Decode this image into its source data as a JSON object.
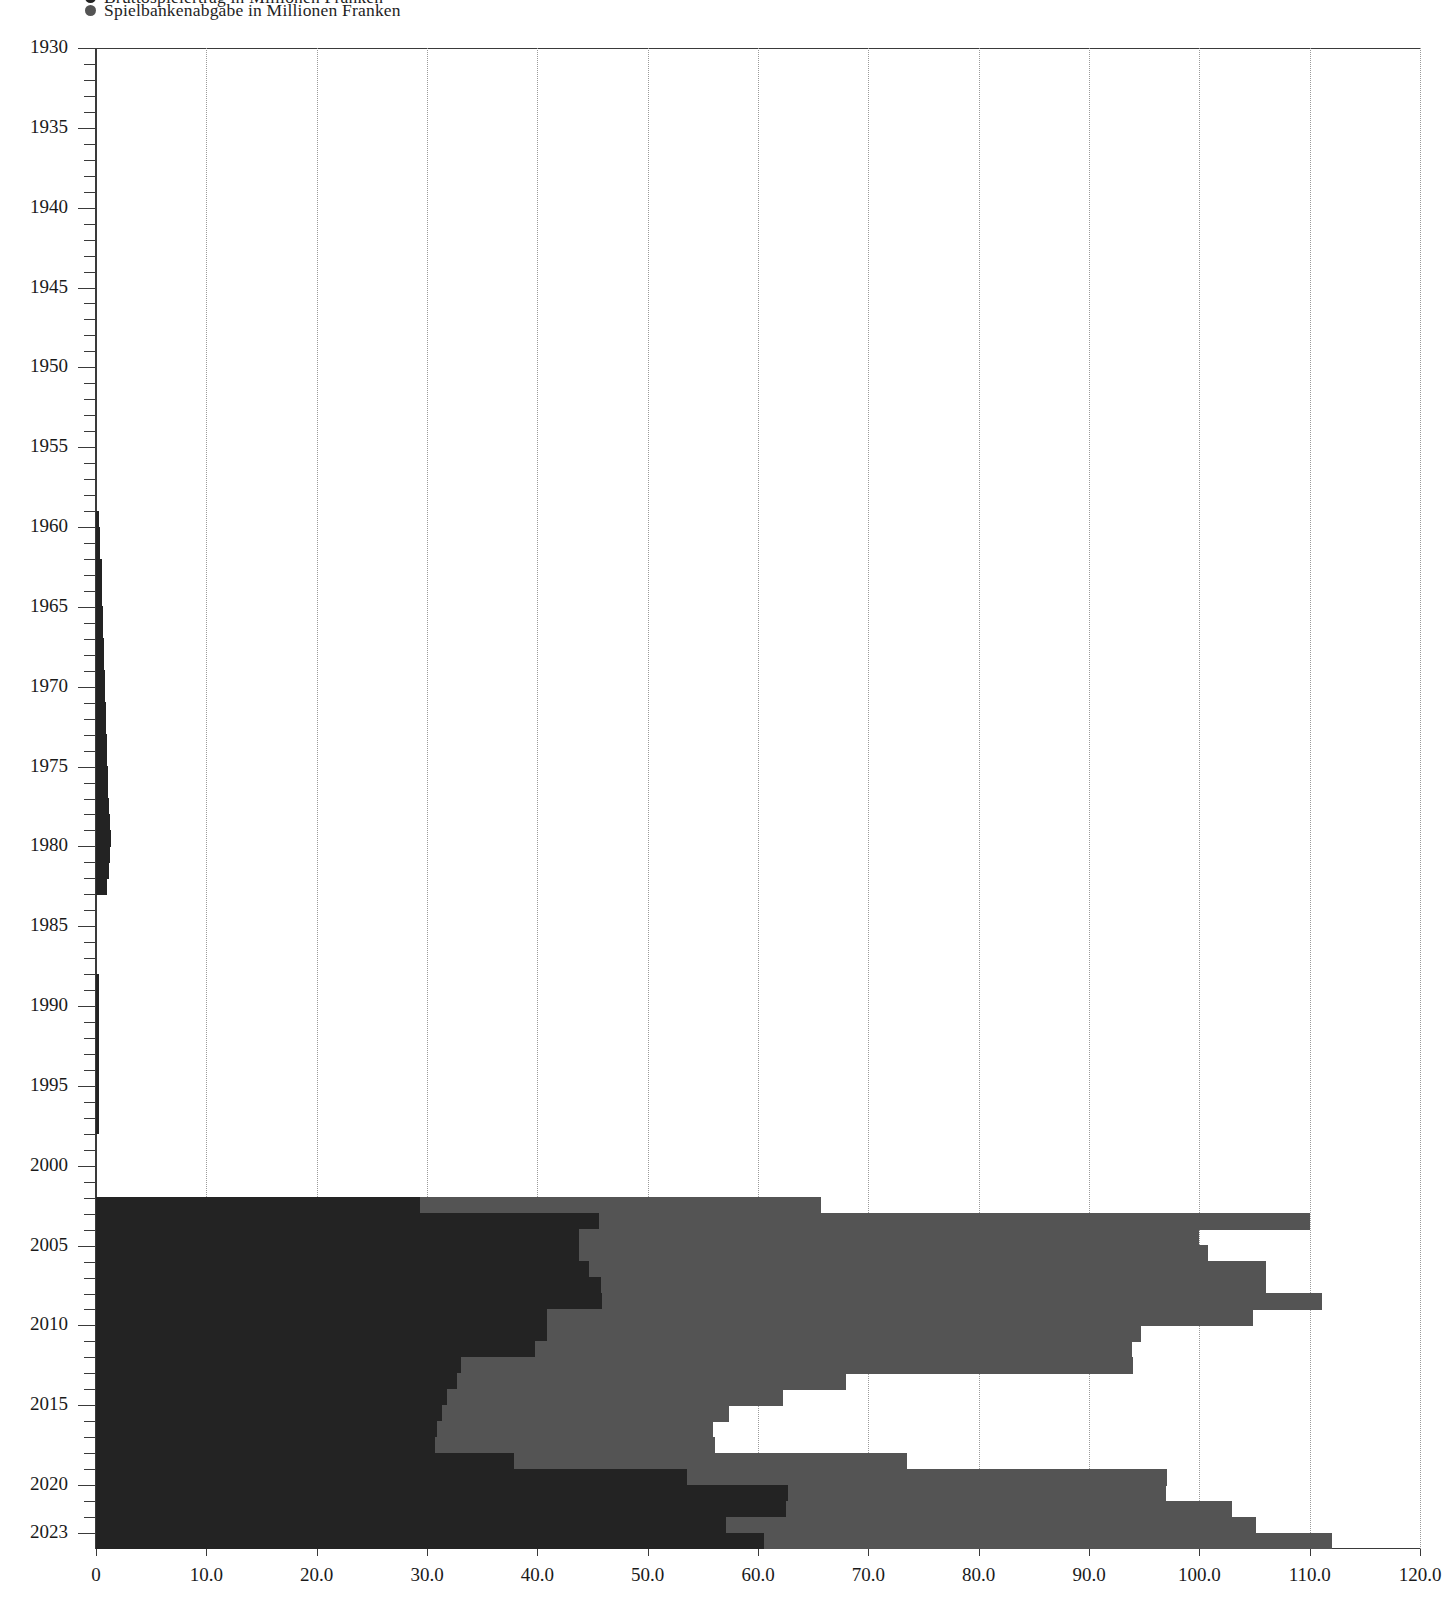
{
  "legend": {
    "clipped_label": "Bruttospielertrag in Millionen Franken",
    "main_label": "Spielbankenabgabe in Millionen Franken",
    "dot_color_clipped": "#232323",
    "dot_color_main": "#545454"
  },
  "axes": {
    "x_labels": [
      "0",
      "10.0",
      "20.0",
      "30.0",
      "40.0",
      "50.0",
      "60.0",
      "70.0",
      "80.0",
      "90.0",
      "100.0",
      "110.0",
      "120.0"
    ],
    "x_values": [
      0,
      10,
      20,
      30,
      40,
      50,
      60,
      70,
      80,
      90,
      100,
      110,
      120
    ],
    "y_labels": [
      "1930",
      "1935",
      "1940",
      "1945",
      "1950",
      "1955",
      "1960",
      "1965",
      "1970",
      "1975",
      "1980",
      "1985",
      "1990",
      "1995",
      "2000",
      "2005",
      "2010",
      "2015",
      "2020",
      "2023"
    ],
    "y_major_values": [
      1930,
      1935,
      1940,
      1945,
      1950,
      1955,
      1960,
      1965,
      1970,
      1975,
      1980,
      1985,
      1990,
      1995,
      2000,
      2005,
      2010,
      2015,
      2020,
      2023
    ],
    "y_min": 1930,
    "y_max": 2023
  },
  "chart_data": {
    "type": "bar",
    "orientation": "horizontal",
    "stacked": true,
    "title": "",
    "xlabel": "",
    "ylabel": "",
    "xlim": [
      0,
      120
    ],
    "ylim": [
      1930,
      2023
    ],
    "grid": "vertical-dotted",
    "legend_position": "top-left",
    "series": [
      {
        "name": "Spielbankenabgabe in Millionen Franken",
        "color": "#232323"
      },
      {
        "name": "weiterer Anteil in Millionen Franken",
        "color": "#545454"
      }
    ],
    "categories": [
      1959,
      1960,
      1961,
      1962,
      1963,
      1964,
      1965,
      1966,
      1967,
      1968,
      1969,
      1970,
      1971,
      1972,
      1973,
      1974,
      1975,
      1976,
      1977,
      1978,
      1979,
      1980,
      1981,
      1982,
      1988,
      1989,
      1990,
      1991,
      1992,
      1993,
      1994,
      1995,
      1996,
      1997,
      2002,
      2003,
      2004,
      2005,
      2006,
      2007,
      2008,
      2009,
      2010,
      2011,
      2012,
      2013,
      2014,
      2015,
      2016,
      2017,
      2018,
      2019,
      2020,
      2021,
      2022,
      2023
    ],
    "dark_values": [
      0.3,
      0.4,
      0.4,
      0.5,
      0.5,
      0.5,
      0.6,
      0.6,
      0.7,
      0.7,
      0.8,
      0.8,
      0.9,
      0.9,
      1.0,
      1.0,
      1.1,
      1.1,
      1.2,
      1.3,
      1.4,
      1.3,
      1.2,
      1.0,
      0.3,
      0.3,
      0.3,
      0.3,
      0.3,
      0.3,
      0.3,
      0.3,
      0.3,
      0.3,
      29.4,
      45.6,
      43.8,
      43.8,
      44.7,
      45.8,
      45.9,
      40.9,
      40.9,
      39.8,
      33.1,
      32.7,
      31.8,
      31.4,
      30.9,
      30.7,
      37.9,
      53.6,
      62.7,
      62.5,
      57.1,
      60.5
    ],
    "light_values": [
      0,
      0,
      0,
      0,
      0,
      0,
      0,
      0,
      0,
      0,
      0,
      0,
      0,
      0,
      0,
      0,
      0,
      0,
      0,
      0,
      0,
      0,
      0,
      0,
      0,
      0,
      0,
      0,
      0,
      0,
      0,
      0,
      0,
      0,
      36.3,
      64.4,
      56.2,
      57.0,
      61.3,
      60.2,
      65.2,
      64.0,
      53.8,
      54.1,
      60.9,
      35.3,
      30.5,
      26.0,
      25.0,
      25.4,
      35.6,
      43.5,
      34.3,
      40.5,
      48.0,
      51.5
    ],
    "totals": [
      0.3,
      0.4,
      0.4,
      0.5,
      0.5,
      0.5,
      0.6,
      0.6,
      0.7,
      0.7,
      0.8,
      0.8,
      0.9,
      0.9,
      1.0,
      1.0,
      1.1,
      1.1,
      1.2,
      1.3,
      1.4,
      1.3,
      1.2,
      1.0,
      0.3,
      0.3,
      0.3,
      0.3,
      0.3,
      0.3,
      0.3,
      0.3,
      0.3,
      0.3,
      65.7,
      110.0,
      100.0,
      100.8,
      106.0,
      106.0,
      111.1,
      104.9,
      94.7,
      93.9,
      94.0,
      68.0,
      62.3,
      57.4,
      55.9,
      56.1,
      73.5,
      97.1,
      97.0,
      103.0,
      105.1,
      112.0
    ]
  }
}
